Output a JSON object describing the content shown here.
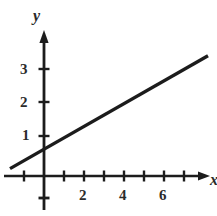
{
  "chart_data": {
    "type": "line",
    "title": "",
    "xlabel": "x",
    "ylabel": "y",
    "grid": false,
    "legend": null,
    "xlim": [
      -1.7,
      8.7
    ],
    "ylim": [
      -1.2,
      4.2
    ],
    "x_ticks": [
      -1,
      1,
      2,
      3,
      4,
      5,
      6,
      7,
      8
    ],
    "y_ticks": [
      -1,
      1,
      2,
      3,
      4
    ],
    "x_tick_labels": [
      "",
      "",
      "2",
      "",
      "4",
      "",
      "6",
      "",
      ""
    ],
    "y_tick_labels": [
      "",
      "1",
      "2",
      "3",
      ""
    ],
    "x_tick_labels_shown": [
      "2",
      "4",
      "6"
    ],
    "y_tick_labels_shown": [
      "1",
      "2",
      "3"
    ],
    "series": [
      {
        "name": "line",
        "slope": 0.34,
        "intercept": 0.8,
        "x": [
          -1.7,
          8.2
        ],
        "y": [
          0.22,
          3.59
        ],
        "color": "#1c1c1c",
        "width": 3.4
      }
    ],
    "axis_color": "#1c1c1c",
    "axis_arrows": [
      "x-positive",
      "y-positive"
    ]
  },
  "axes": {
    "y_name": "y",
    "x_name": "x"
  },
  "labels": {
    "y": {
      "three": "3",
      "two": "2",
      "one": "1"
    },
    "x": {
      "two": "2",
      "four": "4",
      "six": "6"
    }
  }
}
